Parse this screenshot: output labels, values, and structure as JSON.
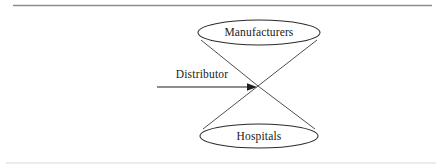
{
  "page": {
    "width": 438,
    "height": 166,
    "background": "#ffffff",
    "ink_color": "#1a1a1a",
    "rule_color": "#8e8e90",
    "rule_color_faint": "#d8d8da"
  },
  "diagram": {
    "type": "bowtie-distribution-diagram",
    "nodes": [
      {
        "id": "manufacturers",
        "label": "Manufacturers",
        "shape": "ellipse",
        "cx": 259,
        "cy": 32.5,
        "rx": 61,
        "ry": 12.5,
        "position": "top"
      },
      {
        "id": "hospitals",
        "label": "Hospitals",
        "shape": "ellipse",
        "cx": 259,
        "cy": 136,
        "rx": 59,
        "ry": 12,
        "position": "bottom"
      }
    ],
    "apex": {
      "x": 258,
      "y": 86
    },
    "edges": [
      {
        "id": "distributor-arrow",
        "label": "Distributor",
        "from_x": 157,
        "to_x": 256,
        "y": 87,
        "has_arrowhead": true,
        "direction": "right"
      }
    ],
    "cone_lines": [
      {
        "from_x": 201,
        "from_y": 40,
        "to_x": 258,
        "to_y": 86
      },
      {
        "from_x": 317,
        "from_y": 40,
        "to_x": 258,
        "to_y": 86
      },
      {
        "from_x": 203,
        "from_y": 129,
        "to_x": 258,
        "to_y": 86
      },
      {
        "from_x": 315,
        "from_y": 129,
        "to_x": 258,
        "to_y": 86
      }
    ],
    "rules": [
      {
        "id": "top-rule",
        "x1": 13,
        "x2": 432,
        "y": 5.5
      },
      {
        "id": "bottom-rule",
        "x1": 6,
        "x2": 436,
        "y": 163
      }
    ],
    "label_positions": {
      "distributor": {
        "x": 202,
        "y": 78
      }
    }
  }
}
